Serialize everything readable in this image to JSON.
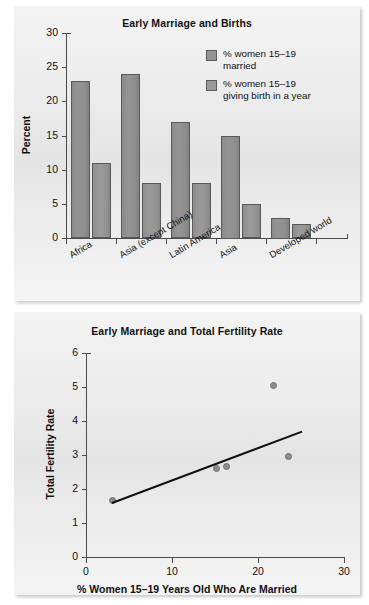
{
  "figure": {
    "panels": 2
  },
  "chart_data": [
    {
      "type": "bar",
      "title": "Early Marriage and Births",
      "xlabel": "",
      "ylabel": "Percent",
      "ylim": [
        0,
        30
      ],
      "yticks": [
        0,
        5,
        10,
        15,
        20,
        25,
        30
      ],
      "grid": false,
      "legend_position": "top-right",
      "categories": [
        "Africa",
        "Asia (except China)",
        "Latin America",
        "Asia",
        "Developed world"
      ],
      "series": [
        {
          "name": "% women 15–19\nmarried",
          "color": "#949494",
          "values": [
            23,
            24,
            17,
            15,
            3
          ]
        },
        {
          "name": "% women 15–19\ngiving birth in a year",
          "color": "#9a9a9a",
          "values": [
            11,
            8,
            8,
            5,
            2
          ]
        }
      ]
    },
    {
      "type": "scatter",
      "title": "Early Marriage and Total Fertility Rate",
      "xlabel": "% Women 15–19 Years Old Who Are Married",
      "ylabel": "Total Fertility Rate",
      "xlim": [
        0,
        30
      ],
      "ylim": [
        0,
        6
      ],
      "xticks": [
        0,
        10,
        20,
        30
      ],
      "yticks": [
        0,
        1,
        2,
        3,
        4,
        5,
        6
      ],
      "grid": false,
      "legend_position": "none",
      "point_color": "#8d8d8d",
      "points": [
        {
          "x": 3.1,
          "y": 1.67
        },
        {
          "x": 15.2,
          "y": 2.6
        },
        {
          "x": 16.3,
          "y": 2.67
        },
        {
          "x": 21.8,
          "y": 5.03
        },
        {
          "x": 23.6,
          "y": 2.95
        }
      ],
      "trendline": {
        "label": "fit line",
        "color": "#111111",
        "x_start": 3.0,
        "y_start": 1.62,
        "x_end": 25.1,
        "y_end": 3.72
      }
    }
  ]
}
